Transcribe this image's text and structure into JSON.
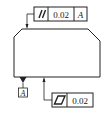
{
  "diagram": {
    "type": "gdt-drawing",
    "part": {
      "shape": "chamfered-block",
      "stroke_color": "#222222"
    },
    "parallelism_frame": {
      "symbol": "//",
      "symbol_name": "parallelism",
      "tolerance": "0.02",
      "datum": "A"
    },
    "datum_feature": {
      "label": "A"
    },
    "flatness_frame": {
      "symbol": "▱",
      "symbol_name": "flatness",
      "tolerance": "0.02"
    }
  }
}
